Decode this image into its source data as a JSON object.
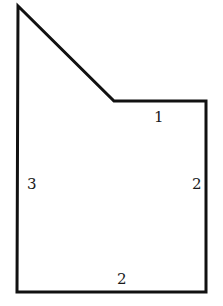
{
  "diagram": {
    "shape": "pentagon",
    "stroke_color": "#111111",
    "stroke_width": 3,
    "vertices": [
      [
        18,
        6
      ],
      [
        114,
        101
      ],
      [
        206,
        101
      ],
      [
        206,
        292
      ],
      [
        17,
        292
      ]
    ],
    "labels": {
      "top_right_edge": "1",
      "left_edge": "3",
      "right_edge": "2",
      "bottom_edge": "2"
    }
  }
}
